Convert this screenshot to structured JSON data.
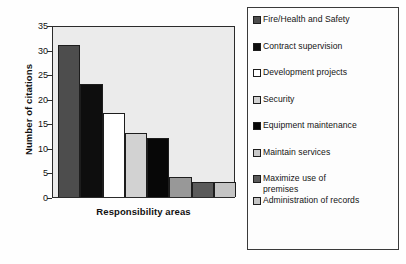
{
  "chart_data": {
    "type": "bar",
    "title": "",
    "xlabel": "Responsibility areas",
    "ylabel": "Number of citations",
    "ylim": [
      0,
      35
    ],
    "yticks": [
      0,
      5,
      10,
      15,
      20,
      25,
      30,
      35
    ],
    "grid": false,
    "legend_position": "right",
    "categories": [
      "Fire/Health and Safety",
      "Contract supervision",
      "Development projects",
      "Security",
      "Equipment maintenance",
      "Maintain services",
      "Maximize use of premises",
      "Administration of records"
    ],
    "values": [
      31,
      23,
      17,
      13,
      12,
      4,
      3,
      3
    ],
    "colors": [
      "#4d4d4d",
      "#0e0e0e",
      "#ffffff",
      "#d2d2d2",
      "#070707",
      "#989898",
      "#5a5a5a",
      "#c4c4c4"
    ],
    "series": [
      {
        "name": "Number of citations",
        "values": [
          31,
          23,
          17,
          13,
          12,
          4,
          3,
          3
        ]
      }
    ]
  },
  "axis": {
    "ylabel": "Number of citations",
    "xlabel": "Responsibility areas",
    "ytick_labels": [
      "0",
      "5",
      "10",
      "15",
      "20",
      "25",
      "30",
      "35"
    ]
  },
  "legend": {
    "items": [
      {
        "label": "Fire/Health and Safety",
        "color": "#4d4d4d"
      },
      {
        "label": "Contract supervision",
        "color": "#0e0e0e"
      },
      {
        "label": "Development projects",
        "color": "#ffffff"
      },
      {
        "label": "Security",
        "color": "#d2d2d2"
      },
      {
        "label": "Equipment maintenance",
        "color": "#070707"
      },
      {
        "label": "Maintain services",
        "color": "#c9c9c9"
      },
      {
        "label": "Maximize use of\npremises",
        "color": "#5a5a5a"
      },
      {
        "label": "Administration of records",
        "color": "#c4c4c4"
      }
    ]
  }
}
